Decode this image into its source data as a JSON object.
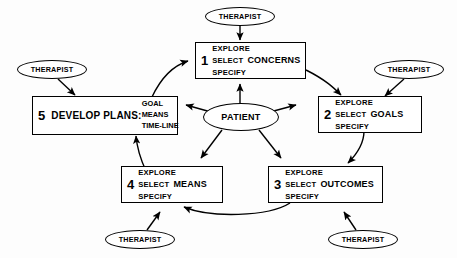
{
  "diagram": {
    "type": "cycle-flowchart",
    "background_color": "#fdfdfd",
    "stroke_color": "#000000",
    "center": {
      "label": "PATIENT",
      "name": "patient-ellipse"
    },
    "steps": [
      {
        "number": "1",
        "lines": [
          "EXPLORE",
          "SELECT",
          "SPECIFY"
        ],
        "topic": "CONCERNS",
        "name": "step-1-concerns"
      },
      {
        "number": "2",
        "lines": [
          "EXPLORE",
          "SELECT",
          "SPECIFY"
        ],
        "topic": "GOALS",
        "name": "step-2-goals"
      },
      {
        "number": "3",
        "lines": [
          "EXPLORE",
          "SELECT",
          "SPECIFY"
        ],
        "topic": "OUTCOMES",
        "name": "step-3-outcomes"
      },
      {
        "number": "4",
        "lines": [
          "EXPLORE",
          "SELECT",
          "SPECIFY"
        ],
        "topic": "MEANS",
        "name": "step-4-means"
      },
      {
        "number": "5",
        "title": "DEVELOP PLANS:",
        "columns": [
          "GOAL",
          "MEANS",
          "TIME-LINE"
        ],
        "name": "step-5-develop-plans"
      }
    ],
    "actors": [
      {
        "label": "THERAPIST",
        "position": "top",
        "target": "step-1-concerns"
      },
      {
        "label": "THERAPIST",
        "position": "right",
        "target": "step-2-goals"
      },
      {
        "label": "THERAPIST",
        "position": "bottom-right",
        "target": "step-3-outcomes"
      },
      {
        "label": "THERAPIST",
        "position": "bottom-left",
        "target": "step-4-means"
      },
      {
        "label": "THERAPIST",
        "position": "left",
        "target": "step-5-develop-plans"
      }
    ],
    "flow_edges": [
      {
        "from": "step-5-develop-plans",
        "to": "step-1-concerns"
      },
      {
        "from": "step-1-concerns",
        "to": "step-2-goals"
      },
      {
        "from": "step-2-goals",
        "to": "step-3-outcomes"
      },
      {
        "from": "step-3-outcomes",
        "to": "step-4-means"
      },
      {
        "from": "step-4-means",
        "to": "step-5-develop-plans"
      }
    ],
    "patient_edges": [
      {
        "from": "patient-ellipse",
        "to": "step-1-concerns"
      },
      {
        "from": "patient-ellipse",
        "to": "step-2-goals"
      },
      {
        "from": "patient-ellipse",
        "to": "step-3-outcomes"
      },
      {
        "from": "patient-ellipse",
        "to": "step-4-means"
      },
      {
        "from": "patient-ellipse",
        "to": "step-5-develop-plans"
      }
    ]
  }
}
